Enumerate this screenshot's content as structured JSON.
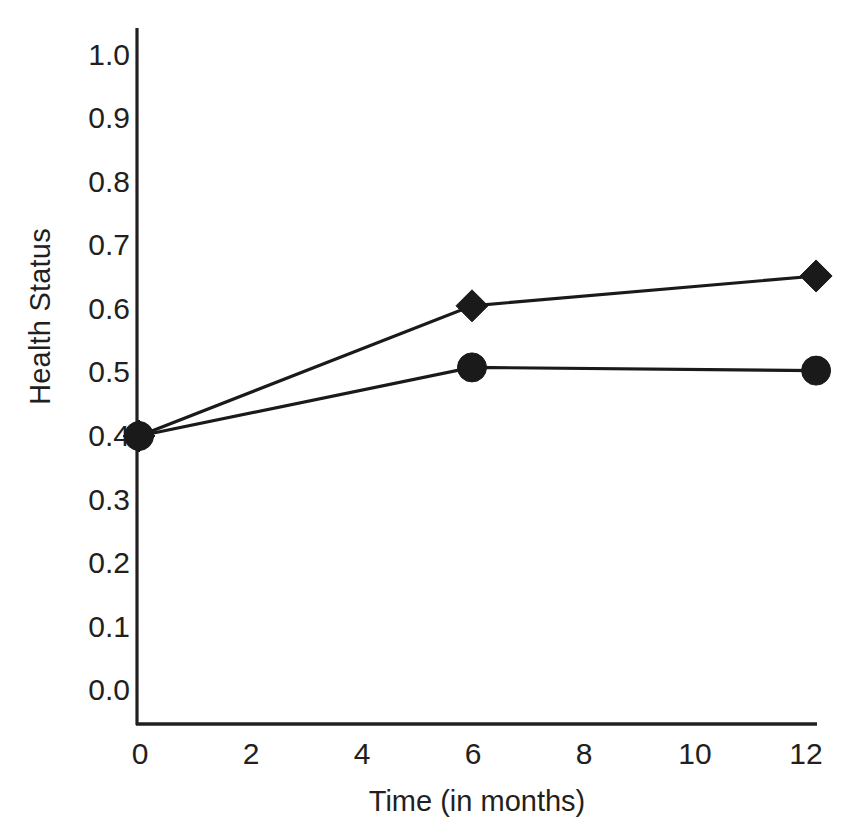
{
  "chart_data": {
    "type": "line",
    "title": "",
    "xlabel": "Time (in months)",
    "ylabel": "Health Status",
    "xlim": [
      0,
      12.8
    ],
    "ylim": [
      0.0,
      1.0
    ],
    "grid": false,
    "legend": "none",
    "xticks": [
      "0",
      "2",
      "4",
      "6",
      "8",
      "10",
      "12"
    ],
    "xtick_values": [
      0,
      2,
      4,
      6,
      8,
      10,
      12
    ],
    "yticks": [
      "0.0",
      "0.1",
      "0.2",
      "0.3",
      "0.4",
      "0.5",
      "0.6",
      "0.7",
      "0.8",
      "0.9",
      "1.0"
    ],
    "ytick_values": [
      0.0,
      0.1,
      0.2,
      0.3,
      0.4,
      0.5,
      0.6,
      0.7,
      0.8,
      0.9,
      1.0
    ],
    "x": [
      0,
      6,
      12.2
    ],
    "series": [
      {
        "name": "diamond-series",
        "marker": "diamond",
        "color": "#1a1a1a",
        "values": [
          0.4,
          0.605,
          0.652
        ]
      },
      {
        "name": "circle-series",
        "marker": "circle",
        "color": "#1a1a1a",
        "values": [
          0.4,
          0.508,
          0.503
        ]
      }
    ]
  },
  "axis": {
    "line_color": "#231f20"
  }
}
